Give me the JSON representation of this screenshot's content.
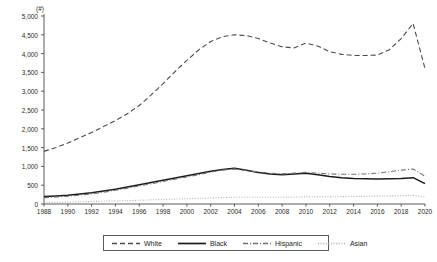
{
  "chart_data": {
    "type": "line",
    "title": "",
    "subtitle": "",
    "xlabel": "",
    "ylabel": "",
    "unit_label": "(#)",
    "grid": false,
    "legend_position": "bottom",
    "xlim": [
      1988,
      2020
    ],
    "ylim": [
      0,
      5000
    ],
    "ytick_labels": [
      "0",
      "500",
      "1,000",
      "1,500",
      "2,000",
      "2,500",
      "3,000",
      "3,500",
      "4,000",
      "4,500",
      "5,000"
    ],
    "ytick_values": [
      0,
      500,
      1000,
      1500,
      2000,
      2500,
      3000,
      3500,
      4000,
      4500,
      5000
    ],
    "xtick_labels": [
      "1988",
      "1990",
      "1992",
      "1994",
      "1996",
      "1998",
      "2000",
      "2002",
      "2004",
      "2006",
      "2008",
      "2010",
      "2012",
      "2014",
      "2016",
      "2018",
      "2020"
    ],
    "xtick_values": [
      1988,
      1990,
      1992,
      1994,
      1996,
      1998,
      2000,
      2002,
      2004,
      2006,
      2008,
      2010,
      2012,
      2014,
      2016,
      2018,
      2020
    ],
    "x": [
      1988,
      1989,
      1990,
      1991,
      1992,
      1993,
      1994,
      1995,
      1996,
      1997,
      1998,
      1999,
      2000,
      2001,
      2002,
      2003,
      2004,
      2005,
      2006,
      2007,
      2008,
      2009,
      2010,
      2011,
      2012,
      2013,
      2014,
      2015,
      2016,
      2017,
      2018,
      2019,
      2020
    ],
    "series": [
      {
        "name": "White",
        "style": "dashed",
        "color": "#4a4a4a",
        "values": [
          1400,
          1500,
          1620,
          1760,
          1900,
          2060,
          2220,
          2400,
          2620,
          2900,
          3200,
          3520,
          3820,
          4100,
          4320,
          4450,
          4500,
          4480,
          4400,
          4280,
          4180,
          4150,
          4280,
          4200,
          4050,
          3980,
          3950,
          3950,
          3960,
          4100,
          4400,
          4800,
          3600
        ]
      },
      {
        "name": "Black",
        "style": "solid",
        "color": "#1c1c1c",
        "values": [
          200,
          215,
          235,
          265,
          300,
          345,
          395,
          450,
          510,
          570,
          630,
          690,
          750,
          810,
          870,
          920,
          950,
          900,
          840,
          800,
          780,
          800,
          820,
          780,
          730,
          700,
          680,
          670,
          665,
          670,
          680,
          700,
          540
        ]
      },
      {
        "name": "Hispanic",
        "style": "dashdot",
        "color": "#707070",
        "values": [
          170,
          185,
          205,
          235,
          270,
          315,
          365,
          420,
          480,
          540,
          600,
          660,
          720,
          780,
          850,
          900,
          930,
          890,
          850,
          820,
          800,
          820,
          840,
          820,
          800,
          790,
          790,
          800,
          820,
          860,
          900,
          930,
          740
        ]
      },
      {
        "name": "Asian",
        "style": "dotted",
        "color": "#b0b0b0",
        "values": [
          40,
          45,
          50,
          58,
          66,
          74,
          82,
          90,
          100,
          110,
          120,
          130,
          140,
          150,
          160,
          170,
          180,
          180,
          180,
          180,
          180,
          185,
          190,
          190,
          190,
          195,
          200,
          205,
          210,
          215,
          220,
          230,
          185
        ]
      }
    ]
  }
}
